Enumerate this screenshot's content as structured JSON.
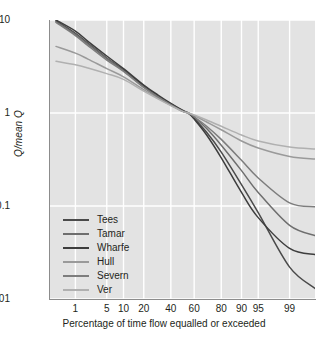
{
  "chart_data": {
    "type": "line",
    "title": "",
    "xlabel": "Percentage of time flow equalled or exceeded",
    "ylabel": "Q/mean Q",
    "yscale": "log",
    "ylim": [
      0.01,
      10
    ],
    "y_ticks": [
      "10",
      "1",
      "0.1",
      "0.01"
    ],
    "y_tick_values": [
      10,
      1,
      0.1,
      0.01
    ],
    "xscale": "probability",
    "xlim": [
      0.2,
      99.8
    ],
    "x_ticks": [
      "1",
      "5",
      "10",
      "20",
      "40",
      "60",
      "80",
      "90",
      "95",
      "99"
    ],
    "x_tick_values": [
      1,
      5,
      10,
      20,
      40,
      60,
      80,
      90,
      95,
      99
    ],
    "grid": true,
    "grid_color": "#ffffff",
    "plot_background": "#e3e3e3",
    "legend_position": "lower left",
    "x": [
      0.3,
      1,
      2,
      5,
      10,
      20,
      30,
      40,
      50,
      55,
      60,
      70,
      80,
      90,
      95,
      99,
      99.8
    ],
    "series": [
      {
        "name": "Tees",
        "color": "#4a4a4a",
        "values": [
          9.8,
          7.2,
          5.6,
          3.9,
          2.9,
          1.95,
          1.52,
          1.25,
          1.06,
          1.0,
          0.88,
          0.62,
          0.38,
          0.17,
          0.085,
          0.022,
          0.013
        ]
      },
      {
        "name": "Tamar",
        "color": "#6e6e6e",
        "values": [
          9.6,
          7.0,
          5.5,
          3.85,
          2.85,
          1.9,
          1.5,
          1.24,
          1.05,
          1.0,
          0.9,
          0.68,
          0.45,
          0.24,
          0.14,
          0.062,
          0.048
        ]
      },
      {
        "name": "Wharfe",
        "color": "#3d3d3d",
        "values": [
          10.0,
          7.6,
          5.9,
          4.1,
          3.0,
          2.0,
          1.55,
          1.27,
          1.07,
          1.0,
          0.86,
          0.58,
          0.33,
          0.14,
          0.075,
          0.035,
          0.03
        ]
      },
      {
        "name": "Hull",
        "color": "#9a9a9a",
        "values": [
          5.2,
          4.4,
          3.8,
          3.0,
          2.45,
          1.78,
          1.44,
          1.21,
          1.04,
          1.0,
          0.94,
          0.8,
          0.66,
          0.5,
          0.42,
          0.34,
          0.32
        ]
      },
      {
        "name": "Severn",
        "color": "#7d7d7d",
        "values": [
          9.4,
          6.8,
          5.3,
          3.7,
          2.8,
          1.88,
          1.48,
          1.23,
          1.05,
          1.0,
          0.91,
          0.72,
          0.52,
          0.31,
          0.2,
          0.108,
          0.098
        ]
      },
      {
        "name": "Ver",
        "color": "#b0b0b0",
        "values": [
          3.6,
          3.3,
          3.05,
          2.65,
          2.3,
          1.72,
          1.41,
          1.2,
          1.04,
          1.0,
          0.95,
          0.84,
          0.72,
          0.58,
          0.5,
          0.43,
          0.41
        ]
      }
    ]
  },
  "legend": {
    "items": [
      {
        "label": "Tees"
      },
      {
        "label": "Tamar"
      },
      {
        "label": "Wharfe"
      },
      {
        "label": "Hull"
      },
      {
        "label": "Severn"
      },
      {
        "label": "Ver"
      }
    ]
  }
}
